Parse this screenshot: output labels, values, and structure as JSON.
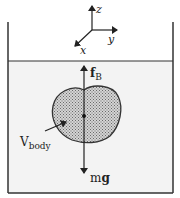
{
  "diagram": {
    "axes": {
      "x_label": "x",
      "y_label": "y",
      "z_label": "z"
    },
    "forces": {
      "buoyancy_label": "f",
      "buoyancy_subscript": "B",
      "weight_label_m": "m",
      "weight_label_g": "g"
    },
    "body": {
      "label": "V",
      "label_subscript": "body"
    },
    "colors": {
      "fluid": "#f2f2f2",
      "body_fill": "#b8b8b8",
      "outline": "#333333"
    }
  }
}
